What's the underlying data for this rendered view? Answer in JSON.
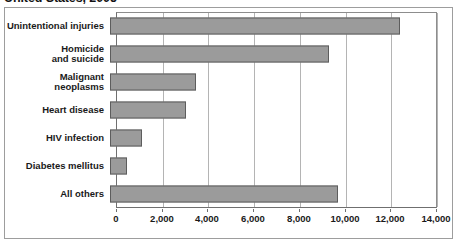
{
  "chart_data": {
    "type": "bar",
    "orientation": "horizontal",
    "title": "United States, 2005",
    "xlabel": "",
    "ylabel": "",
    "categories": [
      "Unintentional injuries",
      "Homicide\nand suicide",
      "Malignant\nneoplasms",
      "Heart disease",
      "HIV infection",
      "Diabetes mellitus",
      "All others"
    ],
    "values": [
      12700,
      9580,
      3760,
      3330,
      1400,
      745,
      9975
    ],
    "xlim": [
      0,
      14000
    ],
    "xticks": [
      0,
      2000,
      4000,
      6000,
      8000,
      10000,
      12000,
      14000
    ],
    "xtick_labels": [
      "0",
      "2,000",
      "4,000",
      "6,000",
      "8,000",
      "10,000",
      "12,000",
      "14,000"
    ],
    "grid": true,
    "grid_axis": "x",
    "legend": null,
    "bar_color": "#9b9b9b",
    "bar_border_color": "#5d5d5d",
    "gridline_color": "#b4b4b4",
    "axis_color": "#6f6f6f",
    "frame_color": "#9d9d9d",
    "text_color": "#1a1a1a"
  }
}
